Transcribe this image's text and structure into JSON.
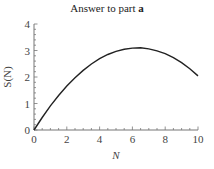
{
  "chart_data": {
    "type": "line",
    "title": "Answer to part a",
    "title_prefix": "Answer to part ",
    "title_bold": "a",
    "xlabel": "N",
    "ylabel": "S(N)",
    "xlim": [
      0,
      10
    ],
    "ylim": [
      0,
      4
    ],
    "x_ticks": [
      0,
      2,
      4,
      6,
      8,
      10
    ],
    "y_ticks": [
      0,
      1,
      2,
      3,
      4
    ],
    "grid": false,
    "legend": null,
    "series": [
      {
        "name": "S(N)",
        "color": "#222222",
        "x": [
          0,
          0.5,
          1,
          1.5,
          2,
          2.5,
          3,
          3.5,
          4,
          4.5,
          5,
          5.5,
          6,
          6.5,
          7,
          7.5,
          8,
          8.5,
          9,
          9.5,
          10
        ],
        "y": [
          0,
          0.47,
          0.91,
          1.3,
          1.66,
          1.97,
          2.25,
          2.49,
          2.69,
          2.85,
          2.97,
          3.05,
          3.09,
          3.1,
          3.06,
          2.99,
          2.88,
          2.73,
          2.54,
          2.31,
          2.04
        ]
      }
    ]
  }
}
